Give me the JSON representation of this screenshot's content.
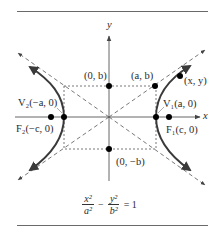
{
  "diagram": {
    "axes": {
      "x_label": "x",
      "y_label": "y"
    },
    "points": {
      "v1": "V₁(a, 0)",
      "v2": "V₂(−a, 0)",
      "f1": "F₁(c, 0)",
      "f2": "F₂(−c, 0)",
      "b_top": "(0, b)",
      "b_bottom": "(0, −b)",
      "ab": "(a, b)",
      "xy": "(x, y)"
    },
    "equation": {
      "term1_num": "x²",
      "term1_den": "a²",
      "minus": "−",
      "term2_num": "y²",
      "term2_den": "b²",
      "rhs": "= 1"
    },
    "colors": {
      "curve": "#3a3a3a",
      "axis": "#555555",
      "dash": "#555555",
      "point": "#000000"
    }
  }
}
